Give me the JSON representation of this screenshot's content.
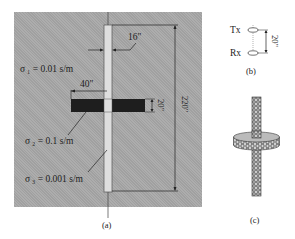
{
  "figure": {
    "panel_a": {
      "caption": "(a)",
      "labels": {
        "sigma1": "σ ₁ = 0.01 s/m",
        "sigma2": "σ ₂ = 0.1 s/m",
        "sigma3": "σ ₃ = 0.001 s/m"
      },
      "dimensions": {
        "borehole_diameter": "16\"",
        "layer_half_width": "40\"",
        "layer_thickness": "20\"",
        "total_height": "220\""
      },
      "colors": {
        "background": "#a9a9a9",
        "layer": "#1e1e1e",
        "borehole": "#dcdcdc"
      }
    },
    "panel_b": {
      "caption": "(b)",
      "transmitter_label": "Tx",
      "receiver_label": "Rx",
      "spacing": "20\""
    },
    "panel_c": {
      "caption": "(c)",
      "description": "meshed tool and layer model"
    }
  }
}
